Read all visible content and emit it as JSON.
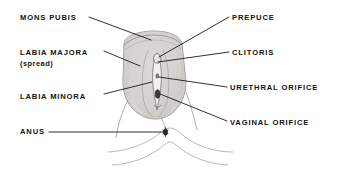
{
  "figure": {
    "background_color": "#ffffff",
    "line_color": "#1a1a1a",
    "text_color": "#111111",
    "figure_fill": "#d8d6d4"
  },
  "labels": {
    "left": [
      {
        "id": "mons-pubis",
        "text": "MONS PUBIS"
      },
      {
        "id": "labia-majora",
        "text": "LABIA MAJORA",
        "subtext": "(spread)"
      },
      {
        "id": "labia-minora",
        "text": "LABIA MINORA"
      },
      {
        "id": "anus",
        "text": "ANUS"
      }
    ],
    "right": [
      {
        "id": "prepuce",
        "text": "PREPUCE"
      },
      {
        "id": "clitoris",
        "text": "CLITORIS"
      },
      {
        "id": "urethral-orifice",
        "text": "URETHRAL ORIFICE"
      },
      {
        "id": "vaginal-orifice",
        "text": "VAGINAL ORIFICE"
      }
    ]
  }
}
